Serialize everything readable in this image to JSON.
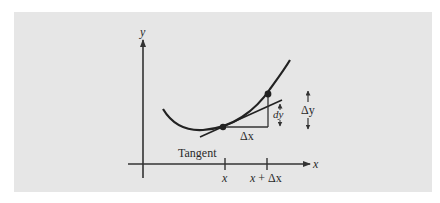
{
  "figure": {
    "background_color": "#e6e6e6",
    "ink_color": "#222222",
    "axes": {
      "x_label": "x",
      "y_label": "y"
    },
    "ticks": [
      {
        "label_var": "x",
        "label_rest": ""
      },
      {
        "label_var": "x",
        "label_rest": " + Δx"
      }
    ],
    "labels": {
      "tangent": "Tangent",
      "delta_x": "Δx",
      "dy": "dy",
      "delta_y": "Δy"
    },
    "points": [
      {
        "name": "point-at-x"
      },
      {
        "name": "point-at-x-plus-dx"
      }
    ]
  }
}
